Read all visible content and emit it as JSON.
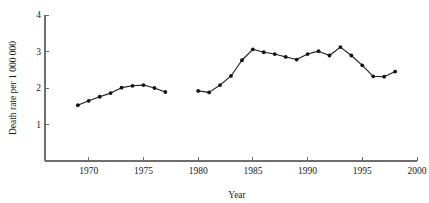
{
  "chart_data": {
    "type": "line",
    "title": "",
    "subtitle": "",
    "xlabel": "Year",
    "ylabel": "Death rate per 1 000 000",
    "xlim": [
      1966,
      2000
    ],
    "ylim": [
      0,
      4
    ],
    "xticks": [
      1970,
      1975,
      1980,
      1985,
      1990,
      1995,
      2000
    ],
    "xtick_labels": [
      "1970",
      "1975",
      "1980",
      "1985",
      "1990",
      "1995",
      "2000"
    ],
    "yticks": [
      1,
      2,
      3,
      4
    ],
    "ytick_labels": [
      "1",
      "2",
      "3",
      "4"
    ],
    "grid": false,
    "legend": false,
    "legend_position": "none",
    "markers": "filled-circle",
    "marker_color": "#121212",
    "line_color": "#1a1a1a",
    "axis_color": "#6e6e6e",
    "series": [
      {
        "name": "segment-1",
        "x": [
          1969,
          1970,
          1971,
          1972,
          1973,
          1974,
          1975,
          1976,
          1977
        ],
        "values": [
          1.53,
          1.65,
          1.76,
          1.86,
          2.01,
          2.06,
          2.08,
          2.0,
          1.89
        ]
      },
      {
        "name": "segment-2",
        "x": [
          1980,
          1981,
          1982,
          1983,
          1984,
          1985,
          1986,
          1987,
          1988,
          1989,
          1990,
          1991,
          1992,
          1993,
          1994,
          1995,
          1996,
          1997,
          1998
        ],
        "values": [
          1.92,
          1.88,
          2.08,
          2.33,
          2.76,
          3.06,
          2.98,
          2.93,
          2.85,
          2.78,
          2.93,
          3.01,
          2.89,
          3.12,
          2.89,
          2.62,
          2.32,
          2.31,
          2.45
        ]
      }
    ]
  }
}
